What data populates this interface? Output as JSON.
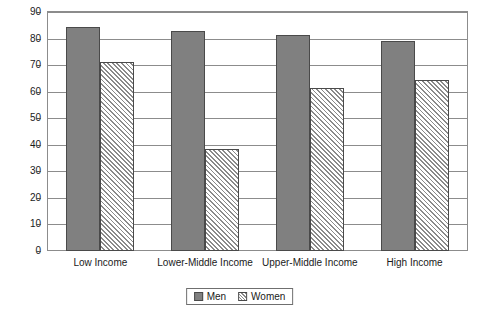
{
  "chart_data": {
    "type": "bar",
    "title": "",
    "subtitle": "",
    "xlabel": "",
    "ylabel": "",
    "categories": [
      "Low Income",
      "Lower-Middle Income",
      "Upper-Middle Income",
      "High Income"
    ],
    "series": [
      {
        "name": "Men",
        "values": [
          84.5,
          83,
          81.5,
          79
        ],
        "color": "#808080",
        "fill": "solid"
      },
      {
        "name": "Women",
        "values": [
          71,
          38.5,
          61.5,
          64.5
        ],
        "color": "#8a8a8a",
        "fill": "diagonal-hatch"
      }
    ],
    "ylim": [
      0,
      90
    ],
    "ytick_step": 10,
    "yticks": [
      0,
      10,
      20,
      30,
      40,
      50,
      60,
      70,
      80,
      90
    ],
    "ytick_labels": [
      "0",
      "10",
      "20",
      "30",
      "40",
      "50",
      "60",
      "70",
      "80",
      "90"
    ],
    "grid": true,
    "grid_axis": "y",
    "legend_position": "bottom-center",
    "legend_entries": [
      "Men",
      "Women"
    ],
    "annotations": []
  },
  "legend": {
    "men_label": "Men",
    "women_label": "Women"
  }
}
